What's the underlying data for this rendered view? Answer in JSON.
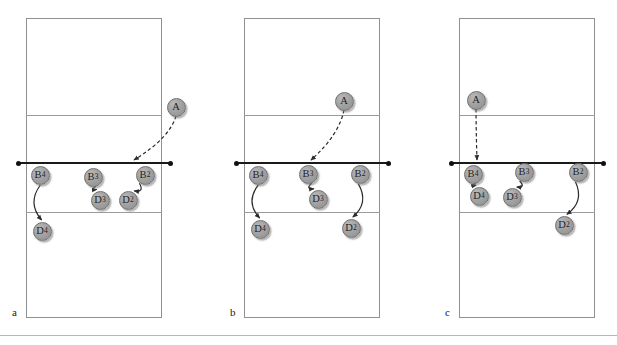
{
  "figure": {
    "type": "volleyball-tactical-diagram",
    "panel_count": 3,
    "colors": {
      "court_line": "#8e9094",
      "inner_line": "#9a9c9f",
      "net": "#1a1a1a",
      "marker_fill": "#a3a3a3",
      "marker_stroke": "#6f6f6f",
      "marker_text": "#1f1f1f",
      "arrow": "#2b2b2b",
      "background": "#ffffff"
    }
  },
  "panels": [
    {
      "id": "panel-a",
      "label": "a",
      "court": {
        "x": 26,
        "y": 18,
        "w": 136,
        "h": 300
      },
      "lines": {
        "attack_top_y": 115,
        "net_y": 162,
        "attack_bottom_y": 212
      },
      "net": {
        "x1": 18,
        "x2": 170,
        "y": 162
      },
      "markers": [
        {
          "id": "A",
          "base": "A",
          "sub": "",
          "x": 176,
          "y": 107
        },
        {
          "id": "B4",
          "base": "B",
          "sub": "4",
          "x": 40,
          "y": 175
        },
        {
          "id": "B3",
          "base": "B",
          "sub": "3",
          "x": 93,
          "y": 177
        },
        {
          "id": "B2",
          "base": "B",
          "sub": "2",
          "x": 145,
          "y": 175
        },
        {
          "id": "D3",
          "base": "D",
          "sub": "3",
          "x": 100,
          "y": 200
        },
        {
          "id": "D2",
          "base": "D",
          "sub": "2",
          "x": 128,
          "y": 200
        },
        {
          "id": "D4",
          "base": "D",
          "sub": "4",
          "x": 42,
          "y": 231
        }
      ],
      "serve_path": {
        "from": "A",
        "to_x": 134,
        "to_y": 160,
        "style": "dashed"
      },
      "move_paths": [
        {
          "from": "B3",
          "to": "D3"
        },
        {
          "from": "B2",
          "to": "D2"
        },
        {
          "from": "B4",
          "to": "D4"
        }
      ]
    },
    {
      "id": "panel-b",
      "label": "b",
      "court": {
        "x": 244,
        "y": 18,
        "w": 136,
        "h": 300
      },
      "lines": {
        "attack_top_y": 115,
        "net_y": 162,
        "attack_bottom_y": 212
      },
      "net": {
        "x1": 236,
        "x2": 388,
        "y": 162
      },
      "markers": [
        {
          "id": "A",
          "base": "A",
          "sub": "",
          "x": 344,
          "y": 101
        },
        {
          "id": "B4",
          "base": "B",
          "sub": "4",
          "x": 258,
          "y": 175
        },
        {
          "id": "B3",
          "base": "B",
          "sub": "3",
          "x": 308,
          "y": 174
        },
        {
          "id": "B2",
          "base": "B",
          "sub": "2",
          "x": 360,
          "y": 174
        },
        {
          "id": "D3",
          "base": "D",
          "sub": "3",
          "x": 318,
          "y": 199
        },
        {
          "id": "D4",
          "base": "D",
          "sub": "4",
          "x": 260,
          "y": 229
        },
        {
          "id": "D2",
          "base": "D",
          "sub": "2",
          "x": 351,
          "y": 228
        }
      ],
      "serve_path": {
        "from": "A",
        "to_x": 311,
        "to_y": 160,
        "style": "dashed"
      },
      "move_paths": [
        {
          "from": "B3",
          "to": "D3"
        },
        {
          "from": "B4",
          "to": "D4"
        },
        {
          "from": "B2",
          "to": "D2"
        }
      ]
    },
    {
      "id": "panel-c",
      "label": "c",
      "court": {
        "x": 459,
        "y": 18,
        "w": 136,
        "h": 300
      },
      "lines": {
        "attack_top_y": 115,
        "net_y": 162,
        "attack_bottom_y": 212
      },
      "net": {
        "x1": 451,
        "x2": 603,
        "y": 162
      },
      "markers": [
        {
          "id": "A",
          "base": "A",
          "sub": "",
          "x": 476,
          "y": 100
        },
        {
          "id": "B4",
          "base": "B",
          "sub": "4",
          "x": 473,
          "y": 174
        },
        {
          "id": "B3",
          "base": "B",
          "sub": "3",
          "x": 524,
          "y": 172
        },
        {
          "id": "B2",
          "base": "B",
          "sub": "2",
          "x": 578,
          "y": 172
        },
        {
          "id": "D4",
          "base": "D",
          "sub": "4",
          "x": 479,
          "y": 196
        },
        {
          "id": "D3",
          "base": "D",
          "sub": "3",
          "x": 512,
          "y": 197
        },
        {
          "id": "D2",
          "base": "D",
          "sub": "2",
          "x": 564,
          "y": 225
        }
      ],
      "serve_path": {
        "from": "A",
        "to_x": 477,
        "to_y": 160,
        "style": "dashed"
      },
      "move_paths": [
        {
          "from": "B4",
          "to": "D4"
        },
        {
          "from": "B3",
          "to": "D3"
        },
        {
          "from": "B2",
          "to": "D2"
        }
      ]
    }
  ],
  "footer_rule": {
    "y": 335
  }
}
